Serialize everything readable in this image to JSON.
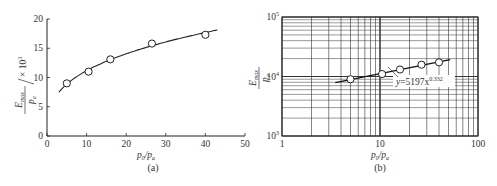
{
  "chart_data": [
    {
      "panel": "(a)",
      "type": "scatter",
      "title": "",
      "xlabel": "p0/pa",
      "ylabel": "Emax/pa / ×10^3",
      "xlim": [
        0,
        50
      ],
      "ylim": [
        0,
        20
      ],
      "xticks": [
        0,
        10,
        20,
        30,
        40,
        50
      ],
      "yticks": [
        0,
        5,
        10,
        15,
        20
      ],
      "grid": false,
      "series": [
        {
          "name": "measured",
          "marker": "open-circle",
          "x": [
            5,
            10.5,
            16,
            26.5,
            40
          ],
          "y": [
            9.0,
            11.0,
            13.1,
            15.8,
            17.3
          ]
        },
        {
          "name": "fit",
          "style": "line",
          "x": [
            3,
            43
          ],
          "formula": "5.197 * x^0.332"
        }
      ]
    },
    {
      "panel": "(b)",
      "type": "scatter",
      "title": "",
      "xlabel": "p0/pa",
      "ylabel": "Emax/pa",
      "xscale": "log",
      "yscale": "log",
      "xlim": [
        1,
        100
      ],
      "ylim": [
        1000,
        100000
      ],
      "xticks": [
        "1",
        "10",
        "100"
      ],
      "yticks": [
        "10^3",
        "10^4",
        "10^5"
      ],
      "grid": true,
      "annotation": "y = 5197x^0.332",
      "series": [
        {
          "name": "measured",
          "marker": "open-circle",
          "x": [
            5,
            10.5,
            16,
            26.5,
            40
          ],
          "y": [
            9000,
            11000,
            13100,
            15800,
            17300
          ]
        },
        {
          "name": "fit",
          "style": "line",
          "x": [
            3.5,
            52
          ],
          "formula": "5197 * x^0.332"
        }
      ]
    }
  ],
  "panels": {
    "a": {
      "label": "(a)",
      "xlabel_main": "p",
      "xlabel_sub0": "0",
      "xlabel_sub1": "a",
      "ylabel_num": "E",
      "ylabel_num_sub": "max",
      "ylabel_den": "p",
      "ylabel_den_sub": "a",
      "ylabel_unit": "× 10",
      "ylabel_unit_exp": "3",
      "xticks": [
        "0",
        "10",
        "20",
        "30",
        "40",
        "50"
      ],
      "yticks": [
        "0",
        "5",
        "10",
        "15",
        "20"
      ]
    },
    "b": {
      "label": "(b)",
      "xlabel_main": "p",
      "xlabel_sub0": "0",
      "xlabel_sub1": "a",
      "ylabel_num": "E",
      "ylabel_num_sub": "max",
      "ylabel_den": "p",
      "ylabel_den_sub": "a",
      "xticks": [
        "1",
        "10",
        "100"
      ],
      "ytick_base": "10",
      "ytick_exps": [
        "3",
        "4",
        "5"
      ],
      "annotation_y": "y",
      "annotation_eq": "=5197x",
      "annotation_exp": "0.332"
    }
  }
}
